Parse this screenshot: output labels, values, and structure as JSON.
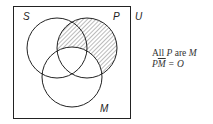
{
  "diagram": {
    "type": "venn-three-set",
    "universe_label": "U",
    "sets": [
      {
        "name": "S",
        "label": "S"
      },
      {
        "name": "P",
        "label": "P"
      },
      {
        "name": "M",
        "label": "M"
      }
    ],
    "shaded_region": "P outside M (P and not-M)",
    "colors": {
      "stroke": "#222222",
      "hatch": "#555555",
      "background": "#ffffff"
    }
  },
  "caption": {
    "line1_prefix": "All ",
    "line1_p": "P",
    "line1_mid": " are ",
    "line1_m": "M",
    "line2_p": "P",
    "line2_mbar": "M",
    "line2_rest": " = O"
  }
}
